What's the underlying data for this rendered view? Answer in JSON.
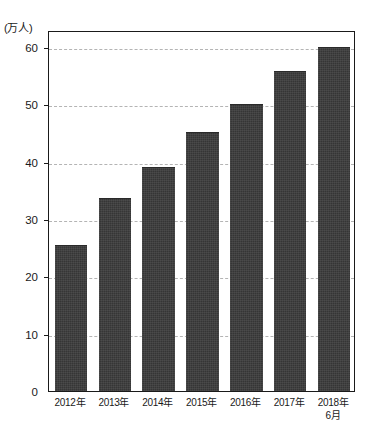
{
  "chart_data": {
    "type": "bar",
    "title": "",
    "subtitle": "",
    "xlabel": "",
    "ylabel": "",
    "unit_label": "(万人)",
    "categories": [
      "2012年",
      "2013年",
      "2014年",
      "2015年",
      "2016年",
      "2017年",
      "2018年"
    ],
    "category_sublabels": [
      "",
      "",
      "",
      "",
      "",
      "",
      "6月"
    ],
    "values": [
      25.3,
      33.5,
      39.0,
      45.0,
      50.0,
      55.7,
      59.8
    ],
    "ylim": [
      0,
      63
    ],
    "yticks": [
      0,
      10,
      20,
      30,
      40,
      50,
      60
    ],
    "ytick_labels": [
      "0",
      "10",
      "20",
      "30",
      "40",
      "50",
      "60"
    ],
    "grid": true,
    "grid_axis": "y",
    "grid_style": "dashed",
    "legend": false,
    "legend_position": "none",
    "series": [
      {
        "name": "",
        "values": [
          25.3,
          33.5,
          39.0,
          45.0,
          50.0,
          55.7,
          59.8
        ]
      }
    ],
    "colors": {
      "bar_fill": "#3b3b3b",
      "grid": "#b4b4b4",
      "axis": "#1a1a1a",
      "background": "#ffffff",
      "text": "#1a1a1a"
    }
  }
}
